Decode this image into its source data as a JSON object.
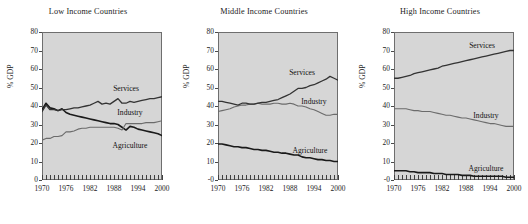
{
  "figure": {
    "ylabel": "% GDP",
    "series_names": [
      "Agriculture",
      "Industry",
      "Services"
    ],
    "colors": {
      "agriculture": "#1a1a1a",
      "industry": "#6b6b6b",
      "services": "#333333",
      "plot_background": "#d6d6d6",
      "frame": "#6e6e6e"
    }
  },
  "chart_data": [
    {
      "type": "line",
      "title": "Low Income Countries",
      "xlabel": "",
      "ylabel": "% GDP",
      "xlim": [
        1970,
        2000
      ],
      "ylim": [
        0,
        80
      ],
      "ytick_labels": [
        "0",
        "10",
        "20",
        "30",
        "40",
        "50",
        "60",
        "70",
        "80"
      ],
      "ytick_values": [
        0,
        10,
        20,
        30,
        40,
        50,
        60,
        70,
        80
      ],
      "xtick_labels": [
        "1970",
        "1976",
        "1982",
        "1988",
        "1994",
        "2000"
      ],
      "xtick_values": [
        1970,
        1976,
        1982,
        1988,
        1994,
        2000
      ],
      "grid": false,
      "legend": "inline-annotation",
      "x": [
        1970,
        1971,
        1972,
        1973,
        1974,
        1975,
        1976,
        1977,
        1978,
        1979,
        1980,
        1981,
        1982,
        1983,
        1984,
        1985,
        1986,
        1987,
        1988,
        1989,
        1990,
        1991,
        1992,
        1993,
        1994,
        1995,
        1996,
        1997,
        1998,
        1999,
        2000
      ],
      "series": [
        {
          "name": "Agriculture",
          "values": [
            38.0,
            41.5,
            39.0,
            38.5,
            37.5,
            38.5,
            36.5,
            35.5,
            35.0,
            34.5,
            34.0,
            33.5,
            33.0,
            32.5,
            32.0,
            31.5,
            31.0,
            30.5,
            30.5,
            30.0,
            28.5,
            27.0,
            29.0,
            28.5,
            27.5,
            27.0,
            26.5,
            26.0,
            25.5,
            25.0,
            24.0
          ]
        },
        {
          "name": "Industry",
          "values": [
            21.5,
            22.5,
            22.5,
            23.5,
            23.5,
            24.0,
            26.0,
            26.0,
            26.5,
            27.5,
            28.0,
            28.0,
            28.5,
            28.5,
            28.5,
            28.5,
            28.5,
            28.5,
            28.5,
            28.0,
            27.0,
            30.5,
            30.5,
            30.5,
            30.5,
            30.5,
            31.0,
            31.0,
            31.0,
            31.5,
            32.0
          ]
        },
        {
          "name": "Services",
          "values": [
            37.0,
            40.5,
            38.0,
            38.0,
            37.5,
            38.0,
            38.0,
            38.5,
            39.0,
            39.0,
            39.5,
            40.0,
            40.5,
            41.5,
            42.5,
            41.0,
            41.5,
            41.0,
            42.5,
            44.0,
            41.5,
            41.5,
            42.5,
            42.0,
            42.5,
            43.0,
            43.5,
            44.0,
            44.0,
            44.5,
            45.0
          ]
        }
      ],
      "annotations": [
        {
          "text": "Services",
          "x": 1991,
          "y": 49.5
        },
        {
          "text": "Industry",
          "x": 1992,
          "y": 37.0
        },
        {
          "text": "Agriculture",
          "x": 1992,
          "y": 19.0
        }
      ]
    },
    {
      "type": "line",
      "title": "Middle Income Countries",
      "xlabel": "",
      "ylabel": "% GDP",
      "xlim": [
        1970,
        2000
      ],
      "ylim": [
        0,
        80
      ],
      "ytick_labels": [
        "-0",
        "10",
        "20",
        "30",
        "40",
        "50",
        "60",
        "70",
        "80"
      ],
      "ytick_values": [
        0,
        10,
        20,
        30,
        40,
        50,
        60,
        70,
        80
      ],
      "xtick_labels": [
        "1970",
        "1976",
        "1982",
        "1988",
        "1994",
        "2000"
      ],
      "xtick_values": [
        1970,
        1976,
        1982,
        1988,
        1994,
        2000
      ],
      "grid": false,
      "legend": "inline-annotation",
      "x": [
        1970,
        1971,
        1972,
        1973,
        1974,
        1975,
        1976,
        1977,
        1978,
        1979,
        1980,
        1981,
        1982,
        1983,
        1984,
        1985,
        1986,
        1987,
        1988,
        1989,
        1990,
        1991,
        1992,
        1993,
        1994,
        1995,
        1996,
        1997,
        1998,
        1999,
        2000
      ],
      "series": [
        {
          "name": "Agriculture",
          "values": [
            19.5,
            19.5,
            19.0,
            18.5,
            18.0,
            18.0,
            17.5,
            17.5,
            17.0,
            16.5,
            16.5,
            16.0,
            16.0,
            15.5,
            15.0,
            15.0,
            14.5,
            14.5,
            14.0,
            13.5,
            13.5,
            12.5,
            12.0,
            12.0,
            11.5,
            11.0,
            11.0,
            10.5,
            10.5,
            10.0,
            10.0
          ]
        },
        {
          "name": "Industry",
          "values": [
            37.0,
            37.5,
            38.0,
            38.5,
            39.5,
            40.0,
            40.5,
            40.5,
            41.0,
            41.0,
            41.5,
            41.0,
            41.0,
            41.0,
            41.5,
            41.5,
            41.0,
            41.0,
            41.5,
            41.0,
            40.0,
            40.0,
            39.5,
            38.5,
            38.0,
            37.0,
            36.0,
            35.0,
            35.0,
            35.5,
            35.5
          ]
        },
        {
          "name": "Services",
          "values": [
            42.5,
            42.5,
            42.0,
            41.5,
            41.0,
            40.5,
            41.5,
            41.5,
            41.0,
            41.0,
            41.5,
            42.0,
            42.0,
            42.5,
            43.0,
            43.5,
            44.5,
            45.5,
            46.5,
            48.0,
            49.5,
            49.5,
            50.0,
            51.0,
            51.5,
            52.5,
            53.5,
            54.5,
            56.0,
            55.0,
            54.0
          ]
        }
      ],
      "annotations": [
        {
          "text": "Services",
          "x": 1991,
          "y": 58.5
        },
        {
          "text": "Industry",
          "x": 1994,
          "y": 42.5
        },
        {
          "text": "Agriculture",
          "x": 1993,
          "y": 16.0
        }
      ]
    },
    {
      "type": "line",
      "title": "High Income Countries",
      "xlabel": "",
      "ylabel": "% GDP",
      "xlim": [
        1970,
        2000
      ],
      "ylim": [
        0,
        80
      ],
      "ytick_labels": [
        "-0",
        "10",
        "20",
        "30",
        "40",
        "50",
        "60",
        "70",
        "80"
      ],
      "ytick_values": [
        0,
        10,
        20,
        30,
        40,
        50,
        60,
        70,
        80
      ],
      "xtick_labels": [
        "1970",
        "1976",
        "1982",
        "1988",
        "1994",
        "2000"
      ],
      "xtick_values": [
        1970,
        1976,
        1982,
        1988,
        1994,
        2000
      ],
      "grid": false,
      "legend": "inline-annotation",
      "x": [
        1970,
        1971,
        1972,
        1973,
        1974,
        1975,
        1976,
        1977,
        1978,
        1979,
        1980,
        1981,
        1982,
        1983,
        1984,
        1985,
        1986,
        1987,
        1988,
        1989,
        1990,
        1991,
        1992,
        1993,
        1994,
        1995,
        1996,
        1997,
        1998,
        1999,
        2000
      ],
      "series": [
        {
          "name": "Agriculture",
          "values": [
            5.0,
            5.0,
            5.0,
            5.0,
            4.5,
            4.5,
            4.0,
            4.0,
            4.0,
            4.0,
            3.5,
            3.5,
            3.5,
            3.0,
            3.0,
            3.0,
            3.0,
            2.5,
            2.5,
            2.5,
            2.0,
            2.0,
            2.0,
            2.0,
            2.0,
            2.0,
            2.0,
            2.0,
            1.5,
            1.5,
            1.5
          ]
        },
        {
          "name": "Industry",
          "values": [
            38.5,
            38.5,
            38.5,
            38.5,
            38.0,
            37.5,
            37.5,
            37.0,
            37.0,
            37.0,
            36.5,
            36.0,
            35.5,
            35.0,
            35.0,
            34.5,
            34.0,
            33.5,
            33.5,
            33.0,
            32.5,
            32.0,
            31.5,
            31.0,
            30.5,
            30.5,
            30.0,
            29.5,
            29.0,
            29.0,
            29.0
          ]
        },
        {
          "name": "Services",
          "values": [
            55.0,
            55.0,
            55.5,
            56.0,
            56.5,
            57.5,
            58.0,
            58.5,
            59.0,
            59.5,
            60.0,
            60.5,
            61.5,
            62.0,
            62.5,
            63.0,
            63.5,
            64.0,
            64.5,
            65.0,
            65.5,
            66.0,
            66.5,
            67.0,
            67.5,
            68.0,
            68.5,
            69.0,
            69.5,
            70.0,
            70.0
          ]
        }
      ],
      "annotations": [
        {
          "text": "Services",
          "x": 1992,
          "y": 73.0
        },
        {
          "text": "Industry",
          "x": 1993,
          "y": 35.0
        },
        {
          "text": "Agriculture",
          "x": 1993,
          "y": 6.5
        }
      ]
    }
  ]
}
